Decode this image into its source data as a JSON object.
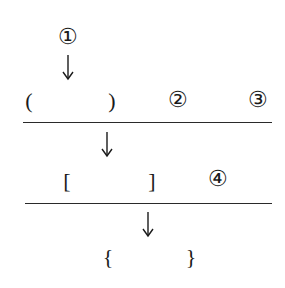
{
  "diagram": {
    "top_label": "①",
    "row1": {
      "open_bracket": "(",
      "close_bracket": ")",
      "label_a": "②",
      "label_b": "③"
    },
    "row2": {
      "open_bracket": "[",
      "close_bracket": "]",
      "label": "④"
    },
    "row3": {
      "open_bracket": "{",
      "close_bracket": "}"
    },
    "ink_color": "#1a1a1a"
  }
}
